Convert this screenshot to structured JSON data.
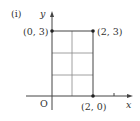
{
  "figure": {
    "part_label": "(i)",
    "axis_x_label": "x",
    "axis_y_label": "y",
    "origin_label": "O",
    "points": [
      {
        "label": "(0, 3)",
        "x": 0,
        "y": 3
      },
      {
        "label": "(2, 3)",
        "x": 2,
        "y": 3
      },
      {
        "label": "(2, 0)",
        "x": 2,
        "y": 0
      }
    ],
    "grid": {
      "x_lines": [
        0,
        1,
        2
      ],
      "y_lines": [
        1,
        2,
        3
      ],
      "x_ticks": [
        3
      ]
    },
    "colors": {
      "line": "#444444",
      "grid": "#888888",
      "text": "#333333",
      "point": "#222222"
    }
  }
}
